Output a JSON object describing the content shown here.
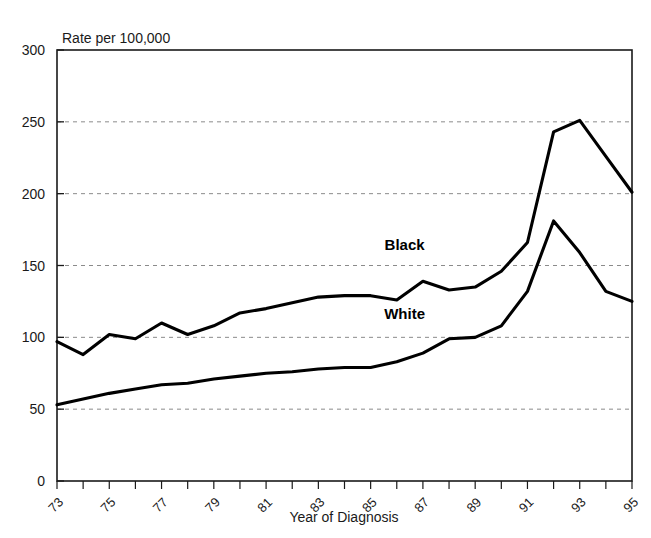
{
  "chart_data": {
    "type": "line",
    "title": "",
    "unit_note": "Rate per 100,000",
    "xlabel": "Year of Diagnosis",
    "ylabel": "",
    "ylim": [
      0,
      300
    ],
    "ytick_step": 50,
    "yticks": [
      "0",
      "50",
      "100",
      "150",
      "200",
      "250",
      "300"
    ],
    "xlim": [
      73,
      95
    ],
    "xticks": [
      "73",
      "74",
      "75",
      "76",
      "77",
      "78",
      "79",
      "80",
      "81",
      "82",
      "83",
      "84",
      "85",
      "86",
      "87",
      "88",
      "89",
      "90",
      "91",
      "92",
      "93",
      "94",
      "95"
    ],
    "xtick_labels_shown": [
      "73",
      "75",
      "77",
      "79",
      "81",
      "83",
      "85",
      "87",
      "89",
      "91",
      "93",
      "95"
    ],
    "xtick_label_rotation": -45,
    "grid": "horizontal-dashed",
    "legend_position": "inline-annotation",
    "x": [
      1973,
      1974,
      1975,
      1976,
      1977,
      1978,
      1979,
      1980,
      1981,
      1982,
      1983,
      1984,
      1985,
      1986,
      1987,
      1988,
      1989,
      1990,
      1991,
      1992,
      1993,
      1994,
      1995
    ],
    "series": [
      {
        "name": "Black",
        "label": "Black",
        "color": "#000000",
        "label_x": 1986.3,
        "label_y": 161,
        "values": [
          97,
          88,
          102,
          99,
          110,
          102,
          108,
          117,
          120,
          124,
          128,
          129,
          129,
          126,
          139,
          133,
          135,
          146,
          166,
          243,
          251,
          226,
          201
        ]
      },
      {
        "name": "White",
        "label": "White",
        "color": "#000000",
        "label_x": 1986.3,
        "label_y": 113,
        "values": [
          53,
          57,
          61,
          64,
          67,
          68,
          71,
          73,
          75,
          76,
          78,
          79,
          79,
          83,
          89,
          99,
          100,
          108,
          132,
          181,
          159,
          132,
          125
        ]
      }
    ]
  }
}
